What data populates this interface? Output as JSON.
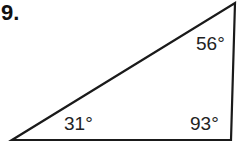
{
  "problem": {
    "number": "9."
  },
  "triangle": {
    "vertices": {
      "top_right": [
        235,
        3
      ],
      "bottom_right": [
        231,
        140
      ],
      "bottom_left": [
        12,
        140
      ]
    },
    "angles": [
      {
        "vertex": "top_right",
        "label": "56°"
      },
      {
        "vertex": "bottom_right",
        "label": "93°"
      },
      {
        "vertex": "bottom_left",
        "label": "31°"
      }
    ],
    "stroke_color": "#1a1a1a"
  }
}
